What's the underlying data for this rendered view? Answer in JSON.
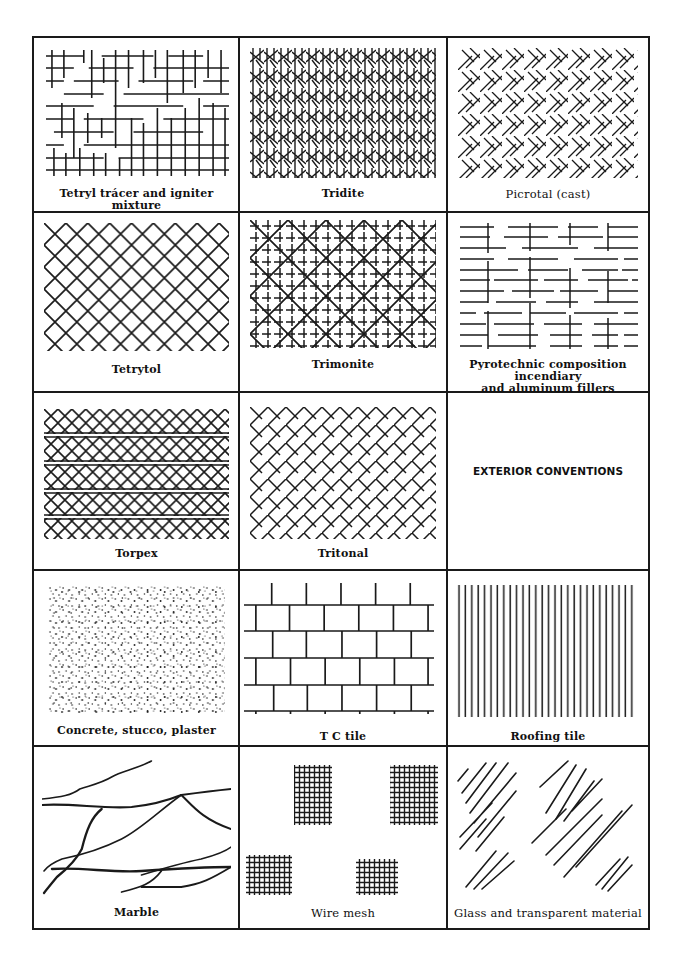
{
  "document": {
    "title_section": "EXTERIOR CONVENTIONS",
    "cells": [
      {
        "row": 0,
        "col": 0,
        "label": "Tetryl trácer and igniter mixture",
        "pattern": "broken-grid-crosses"
      },
      {
        "row": 0,
        "col": 1,
        "label": "Tridite",
        "pattern": "vertical-lines-with-diagonal-crosses"
      },
      {
        "row": 0,
        "col": 2,
        "label": "Picrotal (cast)",
        "pattern": "sparse-diagonal-crosshatch"
      },
      {
        "row": 1,
        "col": 0,
        "label": "Tetrytol",
        "pattern": "diagonal-crosshatch"
      },
      {
        "row": 1,
        "col": 1,
        "label": "Trimonite",
        "pattern": "grid-with-diagonal-crosshatch"
      },
      {
        "row": 1,
        "col": 2,
        "label": "Pyrotechnic composition incendiary and aluminum fillers",
        "label_lines": [
          "Pyrotechnic composition incendiary",
          "and aluminum fillers"
        ],
        "pattern": "broken-horizontal-lines-with-vertical-ticks"
      },
      {
        "row": 2,
        "col": 0,
        "label": "Torpex",
        "pattern": "diagonal-crosshatch-with-double-horizontal-bands"
      },
      {
        "row": 2,
        "col": 1,
        "label": "Tritonal",
        "pattern": "broken-diagonal-crosshatch"
      },
      {
        "row": 2,
        "col": 2,
        "label": "EXTERIOR CONVENTIONS",
        "pattern": "none"
      },
      {
        "row": 3,
        "col": 0,
        "label": "Concrete, stucco, plaster",
        "pattern": "stipple-dots"
      },
      {
        "row": 3,
        "col": 1,
        "label": "T C tile",
        "pattern": "brick-courses"
      },
      {
        "row": 3,
        "col": 2,
        "label": "Roofing tile",
        "pattern": "vertical-lines"
      },
      {
        "row": 4,
        "col": 0,
        "label": "Marble",
        "pattern": "veined-curves"
      },
      {
        "row": 4,
        "col": 1,
        "label": "Wire mesh",
        "pattern": "four-grid-patches"
      },
      {
        "row": 4,
        "col": 2,
        "label": "Glass and transparent material",
        "pattern": "diagonal-line-groups"
      }
    ]
  },
  "colors": {
    "ink": "#1a1a1a",
    "paper": "#ffffff"
  }
}
